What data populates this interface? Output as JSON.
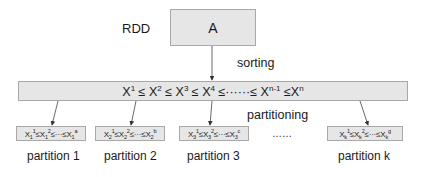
{
  "diagram": {
    "rdd_label": "RDD",
    "rdd_node": "A",
    "sorting_label": "sorting",
    "sorted_sequence": {
      "terms": [
        "X",
        "X",
        "X",
        "X",
        "X",
        "X"
      ],
      "superscripts": [
        "1",
        "2",
        "3",
        "4",
        "n-1",
        "n"
      ],
      "text": "X¹ ≤ X² ≤ X³ ≤ X⁴ ≤……≤ Xⁿ⁻¹ ≤Xⁿ"
    },
    "partitioning_label": "partitioning",
    "ellipsis": "……",
    "partitions": [
      {
        "label": "partition 1",
        "sub": "1",
        "last_sup": "a",
        "text": "X₁¹≤X₁²≤···≤X₁ᵃ"
      },
      {
        "label": "partition 2",
        "sub": "2",
        "last_sup": "b",
        "text": "X₂¹≤X₂²≤···≤X₂ᵇ"
      },
      {
        "label": "partition 3",
        "sub": "3",
        "last_sup": "c",
        "text": "X₃¹≤X₃²≤···≤X₃ᶜ"
      },
      {
        "label": "partition k",
        "sub": "k",
        "last_sup": "g",
        "text": "Xₖ¹≤Xₖ²≤···≤Xₖᵍ"
      }
    ],
    "colors": {
      "box_fill": "#e6e6e6",
      "box_border": "#a8a8a8",
      "line": "#333333",
      "text": "#1a1a1a"
    }
  }
}
